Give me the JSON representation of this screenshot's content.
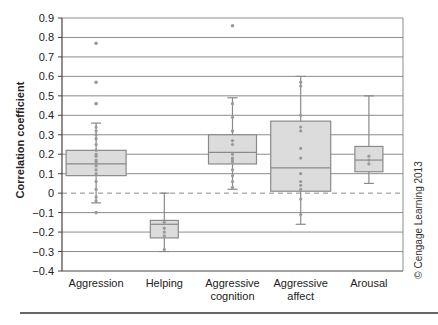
{
  "chart_data": {
    "type": "box",
    "title": "",
    "xlabel": "",
    "ylabel": "Correlation coefficient",
    "ylim": [
      -0.4,
      0.9
    ],
    "yticks": [
      0.9,
      0.8,
      0.7,
      0.6,
      0.5,
      0.4,
      0.3,
      0.2,
      0.1,
      0,
      -0.1,
      -0.2,
      -0.3,
      -0.4
    ],
    "ytick_labels": [
      "0.9",
      "0.8",
      "0.7",
      "0.6",
      "0.5",
      "0.4",
      "0.3",
      "0.2",
      "0.1",
      "0",
      "−0.1",
      "−0.2",
      "−0.3",
      "−0.4"
    ],
    "grid": true,
    "zero_line": "dashed",
    "categories": [
      [
        "Aggression"
      ],
      [
        "Helping"
      ],
      [
        "Aggressive",
        "cognition"
      ],
      [
        "Aggressive",
        "affect"
      ],
      [
        "Arousal"
      ]
    ],
    "boxes": [
      {
        "name": "Aggression",
        "whisker_low": -0.05,
        "q1": 0.09,
        "median": 0.15,
        "q3": 0.22,
        "whisker_high": 0.36,
        "outliers": [
          0.77,
          0.57,
          0.46,
          -0.1
        ],
        "points": [
          0.34,
          0.32,
          0.3,
          0.28,
          0.25,
          0.22,
          0.2,
          0.19,
          0.17,
          0.16,
          0.15,
          0.14,
          0.12,
          0.1,
          0.06,
          0.02,
          -0.02,
          -0.04
        ]
      },
      {
        "name": "Helping",
        "whisker_low": -0.3,
        "q1": -0.23,
        "median": -0.16,
        "q3": -0.14,
        "whisker_high": 0.0,
        "outliers": [],
        "points": [
          -0.15,
          -0.18,
          -0.2,
          -0.22,
          -0.29
        ]
      },
      {
        "name": "Aggressive cognition",
        "whisker_low": 0.02,
        "q1": 0.15,
        "median": 0.21,
        "q3": 0.3,
        "whisker_high": 0.49,
        "outliers": [
          0.86
        ],
        "points": [
          0.46,
          0.39,
          0.32,
          0.27,
          0.25,
          0.2,
          0.18,
          0.17,
          0.16,
          0.12,
          0.09,
          0.06,
          0.03
        ]
      },
      {
        "name": "Aggressive affect",
        "whisker_low": -0.16,
        "q1": 0.01,
        "median": 0.13,
        "q3": 0.37,
        "whisker_high": 0.6,
        "outliers": [],
        "points": [
          0.57,
          0.55,
          0.4,
          0.34,
          0.32,
          0.23,
          0.18,
          0.1,
          0.06,
          0.04,
          0.02,
          -0.03,
          -0.11
        ]
      },
      {
        "name": "Arousal",
        "whisker_low": 0.05,
        "q1": 0.11,
        "median": 0.17,
        "q3": 0.24,
        "whisker_high": 0.5,
        "outliers": [],
        "points": [
          0.19,
          0.17,
          0.15
        ]
      }
    ],
    "colors": {
      "box_fill": "#dcdcdc",
      "box_stroke": "#8a8a8a",
      "point": "#999999",
      "grid": "#8c8c8c",
      "axis": "#444444"
    },
    "annotation": "© Cengage Learning 2013"
  }
}
